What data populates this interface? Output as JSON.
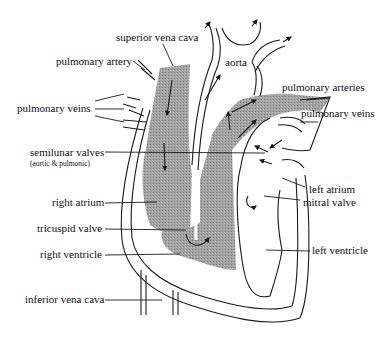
{
  "colors": {
    "deoxygenated_fill": "#9a9a9a",
    "outline": "#1a1a1a",
    "background": "#ffffff"
  },
  "labels": {
    "superior_vena_cava": "superior vena cava",
    "pulmonary_artery": "pulmonary artery",
    "aorta": "aorta",
    "pulmonary_arteries": "pulmonary arteries",
    "pulmonary_veins_left": "pulmonary veins",
    "pulmonary_veins_right": "pulmonary veins",
    "semilunar_valves": "semilunar valves",
    "semilunar_valves_note": "(aortic & pulmonic)",
    "left_atrium": "left atrium",
    "mitral_valve": "mitral valve",
    "right_atrium": "right atrium",
    "tricuspid_valve": "tricuspid valve",
    "right_ventricle": "right ventricle",
    "left_ventricle": "left ventricle",
    "inferior_vena_cava": "inferior vena cava"
  }
}
